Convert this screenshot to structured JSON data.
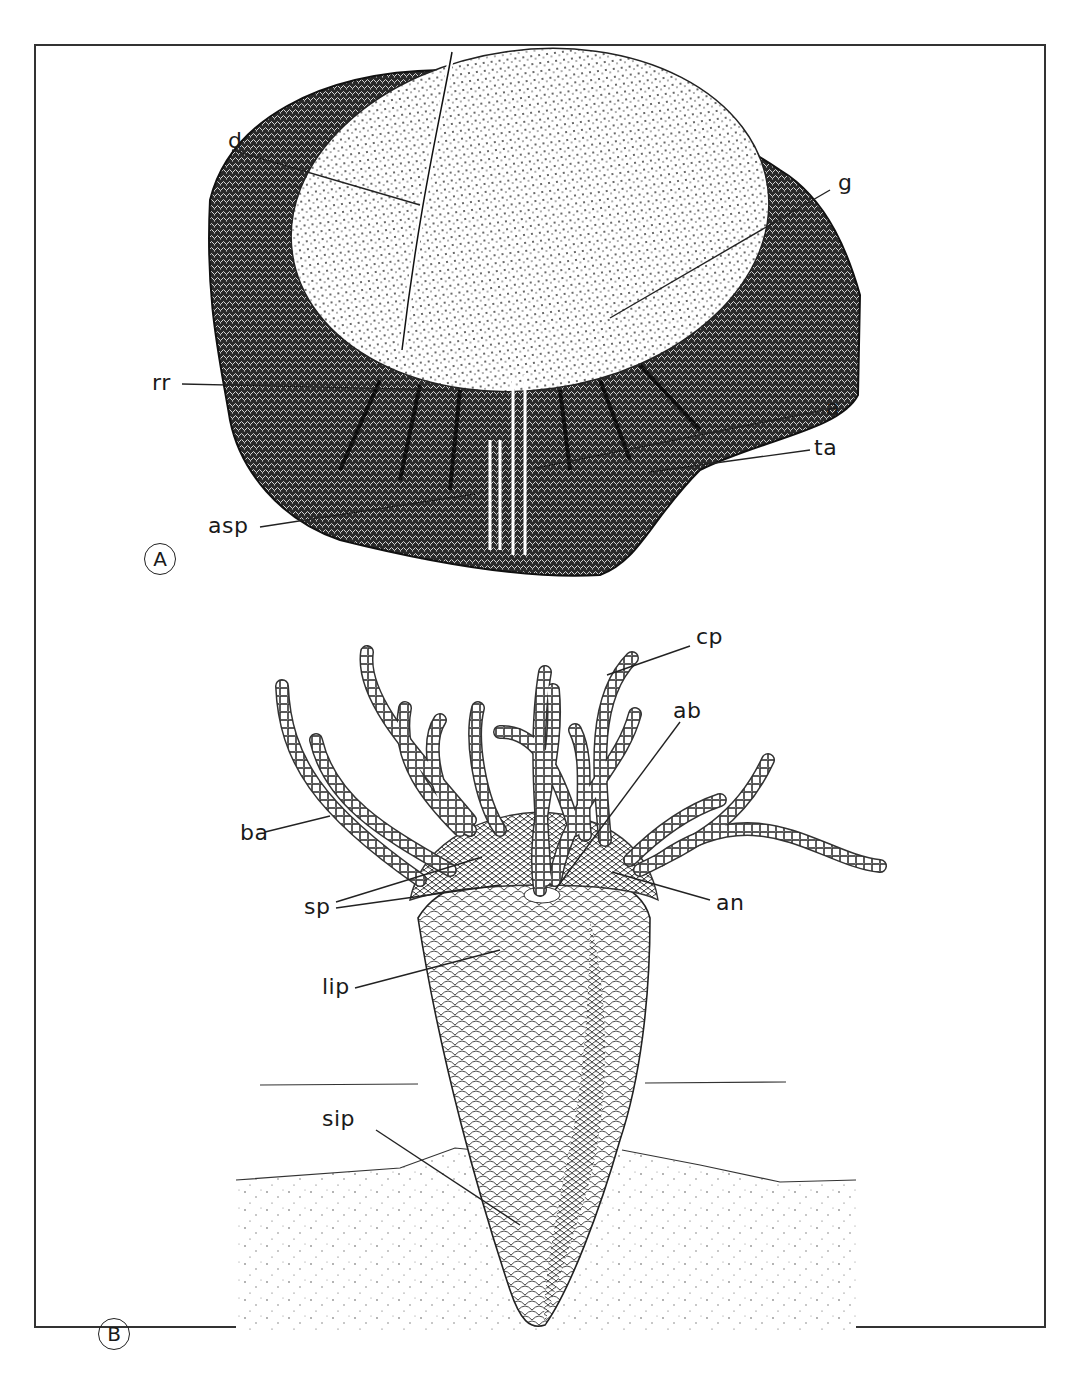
{
  "figure": {
    "panels": [
      {
        "id": "A",
        "tag": "A",
        "description": "fossil specimen with disc and radial ridges",
        "labels": [
          {
            "key": "d",
            "text": "d"
          },
          {
            "key": "g",
            "text": "g"
          },
          {
            "key": "rr",
            "text": "rr"
          },
          {
            "key": "a",
            "text": "a"
          },
          {
            "key": "ta",
            "text": "ta"
          },
          {
            "key": "asp",
            "text": "asp"
          }
        ]
      },
      {
        "id": "B",
        "tag": "B",
        "description": "reconstruction of conical organism with arms, partially buried in sediment",
        "labels": [
          {
            "key": "cp",
            "text": "cp"
          },
          {
            "key": "ab",
            "text": "ab"
          },
          {
            "key": "ba",
            "text": "ba"
          },
          {
            "key": "sp",
            "text": "sp"
          },
          {
            "key": "an",
            "text": "an"
          },
          {
            "key": "lip",
            "text": "lip"
          },
          {
            "key": "sip",
            "text": "sip"
          }
        ]
      }
    ],
    "colors": {
      "ink": "#1a1a1a",
      "paper": "#ffffff",
      "frame": "#333333"
    }
  }
}
